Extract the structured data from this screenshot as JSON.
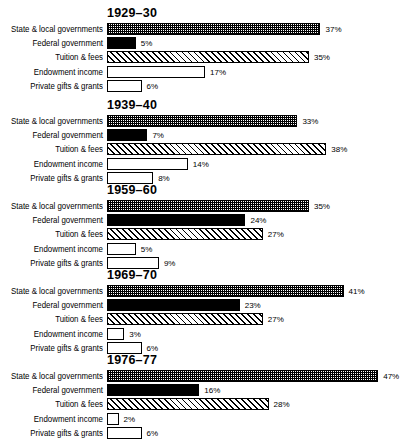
{
  "chart_data": {
    "type": "bar",
    "title": "",
    "xlabel": "",
    "ylabel": "",
    "orientation": "horizontal",
    "grid": false,
    "legend": "none",
    "value_suffix": "%",
    "xlim": [
      0,
      50
    ],
    "categories": [
      "State & local governments",
      "Federal government",
      "Tuition & fees",
      "Endowment income",
      "Private gifts & grants"
    ],
    "groups": [
      {
        "label": "1929–30",
        "values": [
          37,
          5,
          35,
          17,
          6
        ]
      },
      {
        "label": "1939–40",
        "values": [
          33,
          7,
          38,
          14,
          8
        ]
      },
      {
        "label": "1959–60",
        "values": [
          35,
          24,
          27,
          5,
          9
        ]
      },
      {
        "label": "1969–70",
        "values": [
          41,
          23,
          27,
          3,
          6
        ]
      },
      {
        "label": "1976–77",
        "values": [
          47,
          16,
          28,
          2,
          6
        ]
      }
    ],
    "value_labels": [
      [
        "37%",
        "5%",
        "35%",
        "17%",
        "6%"
      ],
      [
        "33%",
        "7%",
        "38%",
        "14%",
        "8%"
      ],
      [
        "35%",
        "24%",
        "27%",
        "5%",
        "9%"
      ],
      [
        "41%",
        "23%",
        "27%",
        "3%",
        "6%"
      ],
      [
        "47%",
        "16%",
        "28%",
        "2%",
        "6%"
      ]
    ],
    "series_patterns": [
      "checker",
      "solid",
      "hatch",
      "white",
      "stipple"
    ],
    "colors": {
      "ink": "#000000",
      "background": "#ffffff"
    }
  }
}
